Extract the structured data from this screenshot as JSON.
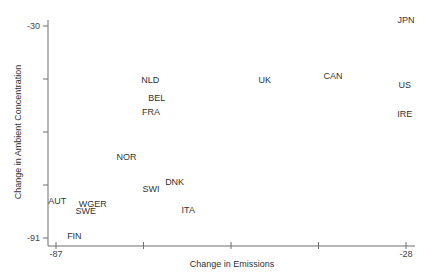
{
  "chart_data": {
    "type": "scatter",
    "title": "",
    "xlabel": "Change in Emissions",
    "ylabel": "Change in Ambient Concentration",
    "xlim": [
      -87,
      -28
    ],
    "ylim": [
      -91,
      -30
    ],
    "x_tick_labels": [
      "-87",
      "",
      "",
      "",
      "-28"
    ],
    "y_tick_labels": [
      "-30",
      "",
      "",
      "",
      "-91"
    ],
    "grid": false,
    "legend": null,
    "marker": "text-label",
    "points": [
      {
        "label": "JPN",
        "x": -28.0,
        "y": -28.3
      },
      {
        "label": "NLD",
        "x": -71.1,
        "y": -45.5
      },
      {
        "label": "UK",
        "x": -51.8,
        "y": -45.5
      },
      {
        "label": "CAN",
        "x": -40.3,
        "y": -44.4
      },
      {
        "label": "US",
        "x": -28.2,
        "y": -47.1
      },
      {
        "label": "BEL",
        "x": -70.0,
        "y": -50.6
      },
      {
        "label": "FRA",
        "x": -71.0,
        "y": -54.7
      },
      {
        "label": "IRE",
        "x": -28.2,
        "y": -55.2
      },
      {
        "label": "NOR",
        "x": -75.1,
        "y": -67.6
      },
      {
        "label": "DNK",
        "x": -67.0,
        "y": -74.8
      },
      {
        "label": "SWI",
        "x": -71.0,
        "y": -76.8
      },
      {
        "label": "AUT",
        "x": -86.8,
        "y": -80.3
      },
      {
        "label": "WGER",
        "x": -80.8,
        "y": -81.2
      },
      {
        "label": "SWE",
        "x": -82.0,
        "y": -83.2
      },
      {
        "label": "ITA",
        "x": -64.7,
        "y": -82.9
      },
      {
        "label": "FIN",
        "x": -83.9,
        "y": -90.4
      }
    ]
  },
  "colors": {
    "axis": "#6f6f6f",
    "text": "#333333",
    "background": "#ffffff"
  }
}
